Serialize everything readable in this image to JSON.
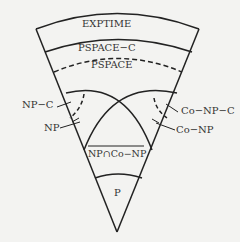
{
  "diagram": {
    "labels": {
      "exptime": "EXPTIME",
      "pspace_c": "PSPACE−C",
      "pspace": "PSPACE",
      "np_c": "NP−C",
      "np": "NP",
      "co_np_c": "Co−NP−C",
      "co_np": "Co−NP",
      "np_cap_conp": "NP∩Co−NP",
      "p": "P"
    },
    "colors": {
      "line": "#222222",
      "text": "#333333",
      "background": "#f3f3f1"
    }
  }
}
